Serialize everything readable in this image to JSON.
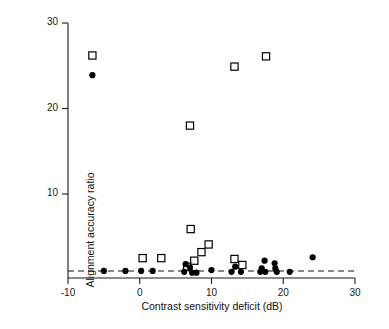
{
  "chart_data": {
    "type": "scatter",
    "title": "",
    "xlabel": "Contrast sensitivity deficit (dB)",
    "ylabel": "Alignment accuracy ratio",
    "xlim": [
      -10,
      30
    ],
    "ylim": [
      0,
      30
    ],
    "xticks": [
      -10,
      0,
      10,
      20,
      30
    ],
    "xtick_labels": [
      "-10",
      "0",
      "10",
      "20",
      "30"
    ],
    "yticks": [
      10,
      20,
      30
    ],
    "ytick_labels": [
      "10",
      "20",
      "30"
    ],
    "grid": false,
    "legend": null,
    "reference_line": {
      "orientation": "horizontal",
      "y": 1,
      "style": "dashed"
    },
    "series": [
      {
        "name": "open-square",
        "marker": "open-square",
        "color": "#000000",
        "points": [
          {
            "x": -6.6,
            "y": 26.2
          },
          {
            "x": 7.0,
            "y": 18.0
          },
          {
            "x": 13.2,
            "y": 24.9
          },
          {
            "x": 17.6,
            "y": 26.1
          },
          {
            "x": 7.1,
            "y": 5.9
          },
          {
            "x": 9.6,
            "y": 4.1
          },
          {
            "x": 8.6,
            "y": 3.2
          },
          {
            "x": 0.4,
            "y": 2.5
          },
          {
            "x": 3.0,
            "y": 2.5
          },
          {
            "x": 13.2,
            "y": 2.4
          },
          {
            "x": 7.6,
            "y": 2.2
          },
          {
            "x": 14.3,
            "y": 1.7
          },
          {
            "x": 6.6,
            "y": 1.5
          }
        ]
      },
      {
        "name": "filled-circle",
        "marker": "filled-circle",
        "color": "#000000",
        "points": [
          {
            "x": -6.6,
            "y": 23.9
          },
          {
            "x": 24.1,
            "y": 2.6
          },
          {
            "x": 17.4,
            "y": 2.2
          },
          {
            "x": 18.8,
            "y": 1.9
          },
          {
            "x": 6.4,
            "y": 1.8
          },
          {
            "x": 7.0,
            "y": 1.4
          },
          {
            "x": 13.3,
            "y": 1.5
          },
          {
            "x": 17.0,
            "y": 1.3
          },
          {
            "x": 18.9,
            "y": 1.3
          },
          {
            "x": -5.0,
            "y": 1.0
          },
          {
            "x": -2.0,
            "y": 1.0
          },
          {
            "x": 0.2,
            "y": 1.0
          },
          {
            "x": 1.8,
            "y": 1.0
          },
          {
            "x": 6.2,
            "y": 0.9
          },
          {
            "x": 7.3,
            "y": 0.8
          },
          {
            "x": 7.9,
            "y": 0.8
          },
          {
            "x": 10.0,
            "y": 1.1
          },
          {
            "x": 12.8,
            "y": 0.9
          },
          {
            "x": 14.1,
            "y": 0.9
          },
          {
            "x": 16.8,
            "y": 0.9
          },
          {
            "x": 17.5,
            "y": 0.9
          },
          {
            "x": 19.1,
            "y": 0.9
          },
          {
            "x": 20.9,
            "y": 0.9
          }
        ]
      }
    ]
  }
}
